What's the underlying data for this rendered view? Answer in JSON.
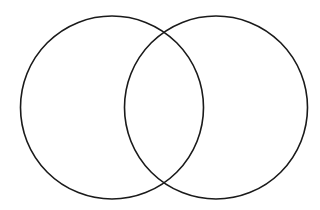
{
  "diagram": {
    "type": "venn",
    "background": "#ffffff",
    "stroke_color": "#1a1a1a",
    "stroke_width": 1.6,
    "circles": [
      {
        "id": "left",
        "cx": 112,
        "cy": 107.5,
        "r": 91.5,
        "label": ""
      },
      {
        "id": "right",
        "cx": 216,
        "cy": 107.5,
        "r": 91.5,
        "label": ""
      }
    ]
  }
}
